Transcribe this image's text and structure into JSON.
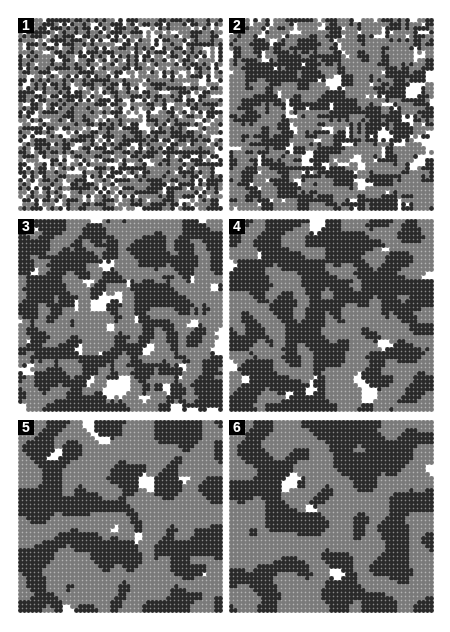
{
  "figure": {
    "palette": {
      "empty": "#ffffff",
      "state_a": "#2a2a2a",
      "state_b": "#7a7a7a"
    },
    "grid": {
      "cols": 51,
      "rows": 48,
      "pitch_px": 4
    },
    "panels": [
      {
        "label": "1",
        "clustering": 0
      },
      {
        "label": "2",
        "clustering": 1
      },
      {
        "label": "3",
        "clustering": 2
      },
      {
        "label": "4",
        "clustering": 3
      },
      {
        "label": "5",
        "clustering": 5
      },
      {
        "label": "6",
        "clustering": 7
      }
    ]
  }
}
